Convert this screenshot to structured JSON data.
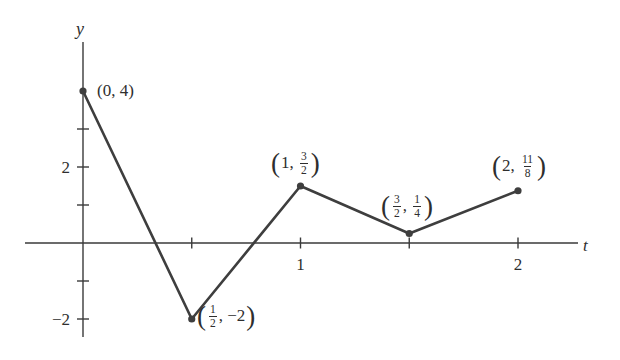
{
  "figure": {
    "background": "#ffffff",
    "line_color": "#3e3e3e",
    "axis_color": "#3a3a3a",
    "text_color": "#2e2e2e"
  },
  "chart_data": {
    "type": "line",
    "title": "",
    "xlabel": "t",
    "ylabel": "y",
    "x": [
      0,
      0.5,
      1,
      1.5,
      2
    ],
    "y": [
      4,
      -2,
      1.5,
      0.25,
      1.375
    ],
    "annotations": [
      "(0, 4)",
      "(1/2, −2)",
      "(1, 3/2)",
      "(3/2, 1/4)",
      "(2, 11/8)"
    ],
    "xticks": [
      0.5,
      1,
      1.5,
      2
    ],
    "yticks": [
      -2,
      -1,
      1,
      2,
      3
    ],
    "xtick_labels": [
      {
        "value": 1,
        "label": "1"
      },
      {
        "value": 2,
        "label": "2"
      }
    ],
    "ytick_labels": [
      {
        "value": 2,
        "label": "2"
      },
      {
        "value": -2,
        "label": "−2"
      }
    ],
    "xlim": [
      -0.27,
      2.28
    ],
    "ylim": [
      -3.1,
      5.3
    ],
    "grid": false,
    "legend": null,
    "marker": "filled-dot"
  },
  "point_labels": [
    {
      "text": "(0, 4)"
    },
    {
      "open": "(",
      "x_num": "1",
      "x_den": "2",
      "rest": ", −2",
      "close": ")"
    },
    {
      "open": "(",
      "pre": "1, ",
      "y_num": "3",
      "y_den": "2",
      "close": ")"
    },
    {
      "open": "(",
      "x_num": "3",
      "x_den": "2",
      "comma": ", ",
      "y_num": "1",
      "y_den": "4",
      "close": ")"
    },
    {
      "open": "(",
      "pre": "2, ",
      "y_num": "11",
      "y_den": "8",
      "close": ")"
    }
  ]
}
